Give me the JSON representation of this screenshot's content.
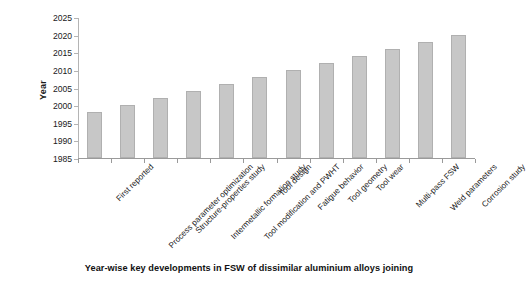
{
  "chart_data": {
    "type": "bar",
    "title": "",
    "caption": "Year-wise key developments in FSW of dissimilar aluminium alloys joining",
    "xlabel": "",
    "ylabel": "Year",
    "ylim": [
      1985,
      2025
    ],
    "ytick_step": 5,
    "yticks": [
      1985,
      1990,
      1995,
      2000,
      2005,
      2010,
      2015,
      2020,
      2025
    ],
    "ytick_labels": [
      "1985",
      "1990",
      "1995",
      "2000",
      "2005",
      "2010",
      "2015",
      "2020",
      "2025"
    ],
    "grid": false,
    "legend": false,
    "legend_position": "none",
    "bar_color": "#c7c7c7",
    "bar_edge_color": "#b0b0b0",
    "axis_color": "#9a9a9a",
    "text_color": "#1a1a1a",
    "categories": [
      "First reported",
      "Process parameter optimization",
      "Structure-properties study",
      "Intermetallic formation study",
      "Tool modification and PWHT",
      "Tool design",
      "Fatigue behavior",
      "Tool geometry",
      "Tool wear",
      "Multi-pass FSW",
      "Weld parameters",
      "Corrosion study"
    ],
    "values": [
      1998,
      2000,
      2002,
      2004,
      2006,
      2008,
      2010,
      2012,
      2014,
      2016,
      2018,
      2020
    ]
  }
}
